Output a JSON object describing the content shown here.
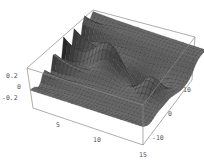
{
  "chart_data": {
    "type": "surface3d",
    "title": "",
    "xlabel": "",
    "ylabel": "",
    "zlabel": "",
    "x_ticks": [
      "5",
      "10",
      "15"
    ],
    "y_ticks": [
      "-10",
      "0",
      "10"
    ],
    "z_ticks": [
      "0.2",
      "0",
      "-0.2"
    ],
    "xlim": [
      0,
      15
    ],
    "ylim": [
      -15,
      15
    ],
    "zlim": [
      -0.3,
      0.3
    ],
    "surface_color": "#5a5a5a",
    "mesh_color": "#222222",
    "box_color": "#8a8a8a"
  },
  "labels": {
    "z": [
      "0.2",
      "0",
      "-0.2"
    ],
    "x": [
      "5",
      "10",
      "15"
    ],
    "y": [
      "10",
      "0",
      "-10"
    ]
  }
}
